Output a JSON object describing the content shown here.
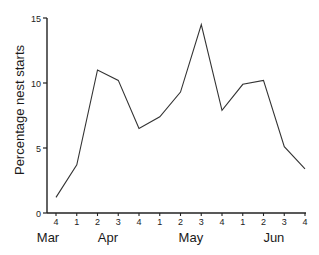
{
  "chart_data": {
    "type": "line",
    "title": "",
    "xlabel": "",
    "ylabel": "Percentage nest starts",
    "ylim": [
      0,
      15
    ],
    "yticks": [
      0,
      5,
      10,
      15
    ],
    "grid": false,
    "legend": null,
    "x": [
      "Mar 4",
      "Apr 1",
      "Apr 2",
      "Apr 3",
      "Apr 4",
      "May 1",
      "May 2",
      "May 3",
      "May 4",
      "Jun 1",
      "Jun 2",
      "Jun 3",
      "Jun 4"
    ],
    "xtick_labels": [
      "4",
      "1",
      "2",
      "3",
      "4",
      "1",
      "2",
      "3",
      "4",
      "1",
      "2",
      "3",
      "4"
    ],
    "month_labels": [
      {
        "label": "Mar",
        "tick_index": 0
      },
      {
        "label": "Apr",
        "tick_index": 2.5
      },
      {
        "label": "May",
        "tick_index": 6.5
      },
      {
        "label": "Jun",
        "tick_index": 10.5
      }
    ],
    "series": [
      {
        "name": "Percentage nest starts",
        "values": [
          1.2,
          3.7,
          11.0,
          10.2,
          6.5,
          7.4,
          9.3,
          14.5,
          7.9,
          9.9,
          10.2,
          5.1,
          3.4
        ]
      }
    ],
    "line_color": "#333333"
  }
}
